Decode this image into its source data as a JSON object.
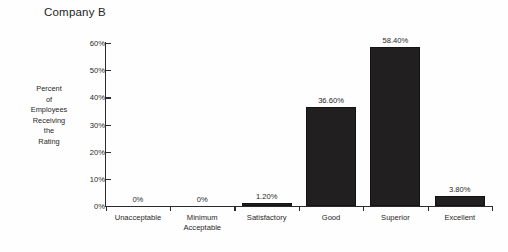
{
  "chart_data": {
    "type": "bar",
    "title": "Company B",
    "xlabel": "",
    "ylabel": "Percent of Employees Receiving the Rating",
    "ylabel_lines": [
      "Percent",
      "of",
      "Employees",
      "Receiving",
      "the",
      "Rating"
    ],
    "categories": [
      "Unacceptable",
      "Minimum Acceptable",
      "Satisfactory",
      "Good",
      "Superior",
      "Excellent"
    ],
    "category_lines": [
      [
        "Unacceptable"
      ],
      [
        "Minimum",
        "Acceptable"
      ],
      [
        "Satisfactory"
      ],
      [
        "Good"
      ],
      [
        "Superior"
      ],
      [
        "Excellent"
      ]
    ],
    "values": [
      0,
      0,
      1.2,
      36.6,
      58.4,
      3.8
    ],
    "value_labels": [
      "0%",
      "0%",
      "1.20%",
      "36.60%",
      "58.40%",
      "3.80%"
    ],
    "ylim": [
      0,
      60
    ],
    "yticks": [
      0,
      10,
      20,
      30,
      40,
      50,
      60
    ],
    "ytick_labels": [
      "0%",
      "10%",
      "20%",
      "30%",
      "40%",
      "50%",
      "60%"
    ],
    "grid": false,
    "legend": false,
    "bar_color": "#211f1f",
    "axis_color": "#2b2b2b",
    "background": "#fefefe"
  }
}
